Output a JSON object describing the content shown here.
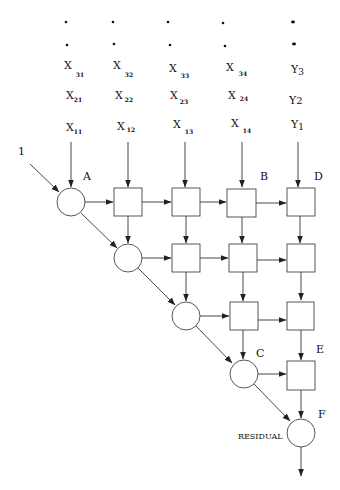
{
  "diagram": {
    "title": "",
    "input_label": "1",
    "columns": [
      {
        "x": 71,
        "inputs": [
          {
            "base": "X",
            "sub": "31"
          },
          {
            "base": "X",
            "sub": "21"
          },
          {
            "base": "X",
            "sub": "11"
          }
        ]
      },
      {
        "x": 128,
        "inputs": [
          {
            "base": "X",
            "sub": "32"
          },
          {
            "base": "X",
            "sub": "22"
          },
          {
            "base": "X",
            "sub": "12"
          }
        ]
      },
      {
        "x": 185,
        "inputs": [
          {
            "base": "X",
            "sub": "33"
          },
          {
            "base": "X",
            "sub": "23"
          },
          {
            "base": "X",
            "sub": "13"
          }
        ]
      },
      {
        "x": 243,
        "inputs": [
          {
            "base": "X",
            "sub": "34"
          },
          {
            "base": "X",
            "sub": "24"
          },
          {
            "base": "X",
            "sub": "14"
          }
        ]
      },
      {
        "x": 300,
        "inputs": [
          {
            "base": "Y",
            "sub": "3"
          },
          {
            "base": "Y",
            "sub": "2"
          },
          {
            "base": "Y",
            "sub": "1"
          }
        ]
      }
    ],
    "node_labels": {
      "A": "A",
      "B": "B",
      "C": "C",
      "D": "D",
      "E": "E",
      "F": "F"
    },
    "residual_label": "RESIDUAL",
    "node_types": {
      "circle": "boundary-cell",
      "square": "internal-cell"
    },
    "rows": [
      {
        "circle_col": 0,
        "box_cols": [
          1,
          2,
          3,
          4
        ]
      },
      {
        "circle_col": 1,
        "box_cols": [
          2,
          3,
          4
        ]
      },
      {
        "circle_col": 2,
        "box_cols": [
          3,
          4
        ]
      },
      {
        "circle_col": 3,
        "box_cols": [
          4
        ]
      },
      {
        "circle_col": 4,
        "box_cols": []
      }
    ]
  }
}
